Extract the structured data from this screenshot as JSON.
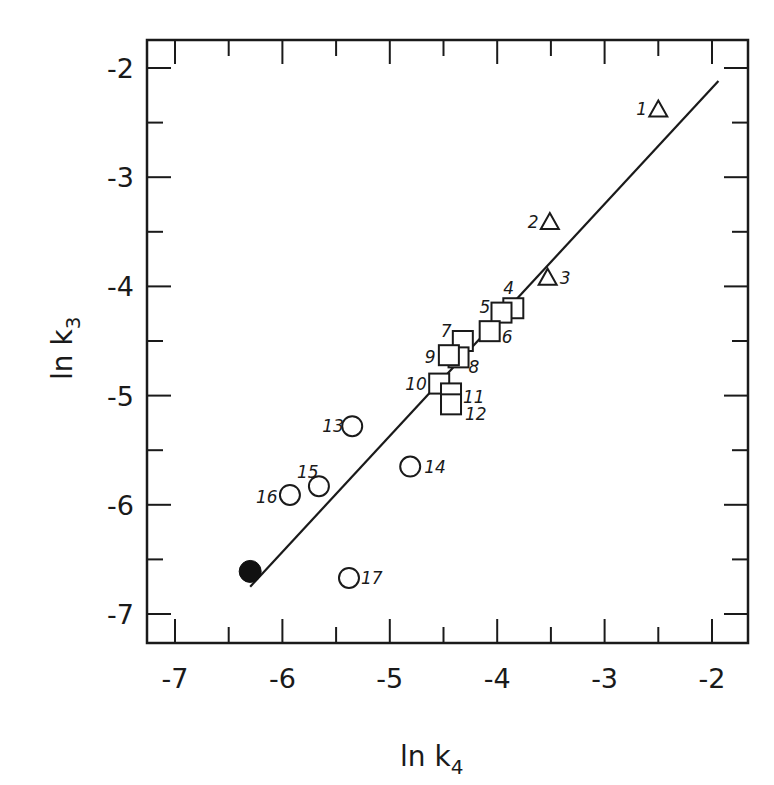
{
  "chart_data": {
    "type": "scatter",
    "title": "",
    "xlabel": "ln k4",
    "ylabel": "ln k3",
    "xlim": [
      -7.3,
      -1.7
    ],
    "ylim": [
      -7.3,
      -1.75
    ],
    "grid": false,
    "legend": null,
    "x_ticks": [
      -7,
      -6,
      -5,
      -4,
      -3,
      -2
    ],
    "y_ticks": [
      -2,
      -3,
      -4,
      -5,
      -6,
      -7
    ],
    "x_tick_labels": [
      "-7",
      "-6",
      "-5",
      "-4",
      "-3",
      "-2"
    ],
    "y_tick_labels": [
      "-2",
      "-3",
      "-4",
      "-5",
      "-6",
      "-7"
    ],
    "series": [
      {
        "name": "triangles",
        "marker": "triangle-open",
        "points": [
          {
            "label": "1",
            "x": -2.5,
            "y": -2.38
          },
          {
            "label": "2",
            "x": -3.51,
            "y": -3.41
          },
          {
            "label": "3",
            "x": -3.53,
            "y": -3.92
          }
        ]
      },
      {
        "name": "squares",
        "marker": "square-open",
        "points": [
          {
            "label": "4",
            "x": -3.85,
            "y": -4.2
          },
          {
            "label": "5",
            "x": -3.96,
            "y": -4.24
          },
          {
            "label": "6",
            "x": -4.07,
            "y": -4.41
          },
          {
            "label": "7",
            "x": -4.32,
            "y": -4.5
          },
          {
            "label": "8",
            "x": -4.36,
            "y": -4.65
          },
          {
            "label": "9",
            "x": -4.45,
            "y": -4.63
          },
          {
            "label": "10",
            "x": -4.54,
            "y": -4.89
          },
          {
            "label": "11",
            "x": -4.43,
            "y": -4.98
          },
          {
            "label": "12",
            "x": -4.43,
            "y": -5.08
          }
        ]
      },
      {
        "name": "circles",
        "marker": "circle-open",
        "points": [
          {
            "label": "13",
            "x": -5.35,
            "y": -5.28
          },
          {
            "label": "14",
            "x": -4.81,
            "y": -5.65
          },
          {
            "label": "15",
            "x": -5.66,
            "y": -5.83
          },
          {
            "label": "16",
            "x": -5.93,
            "y": -5.91
          },
          {
            "label": "17",
            "x": -5.38,
            "y": -6.67
          }
        ]
      },
      {
        "name": "filled",
        "marker": "circle-filled",
        "points": [
          {
            "label": "",
            "x": -6.3,
            "y": -6.61
          }
        ]
      }
    ],
    "fit_line": {
      "x": [
        -6.3,
        -1.94
      ],
      "y": [
        -6.75,
        -2.12
      ]
    }
  }
}
